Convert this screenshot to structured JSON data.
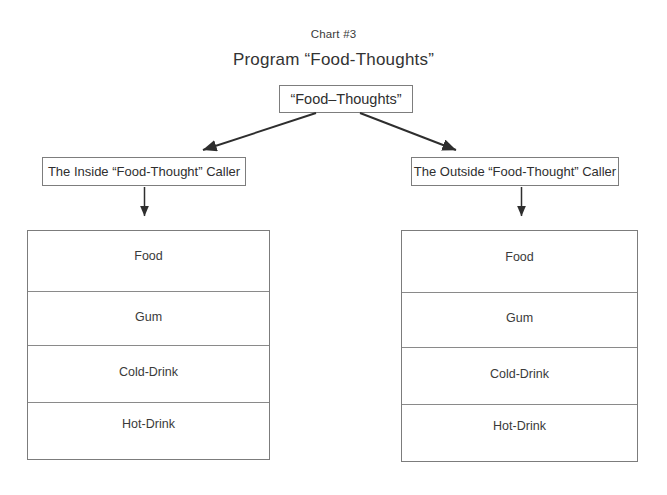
{
  "chart_label": "Chart #3",
  "program_title": "Program “Food-Thoughts”",
  "root": {
    "label": "“Food–Thoughts”"
  },
  "branches": [
    {
      "id": "inside",
      "label": "The Inside “Food-Thought” Caller",
      "items": [
        "Food",
        "Gum",
        "Cold-Drink",
        "Hot-Drink"
      ]
    },
    {
      "id": "outside",
      "label": "The Outside “Food-Thought” Caller",
      "items": [
        "Food",
        "Gum",
        "Cold-Drink",
        "Hot-Drink"
      ]
    }
  ],
  "colors": {
    "background": "#ffffff",
    "box_border": "#7d7d7d",
    "row_divider": "#8a8a8a",
    "arrow": "#2e2e2e",
    "text": "#2f2f2f"
  },
  "connectors": [
    {
      "name": "root-to-inside",
      "from": "root-box",
      "to": "inside-box",
      "style": "diagonal-arrow"
    },
    {
      "name": "root-to-outside",
      "from": "root-box",
      "to": "outside-box",
      "style": "diagonal-arrow"
    },
    {
      "name": "inside-to-left-table",
      "from": "inside-box",
      "to": "left-table",
      "style": "vertical-arrow"
    },
    {
      "name": "outside-to-right-table",
      "from": "outside-box",
      "to": "right-table",
      "style": "vertical-arrow"
    }
  ]
}
